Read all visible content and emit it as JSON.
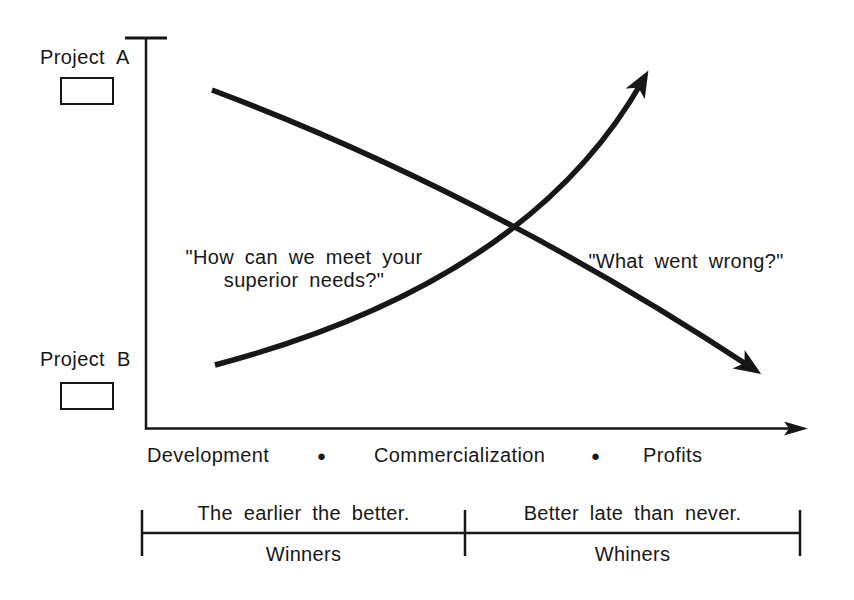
{
  "figure": {
    "projects": [
      {
        "label": "Project A"
      },
      {
        "label": "Project B"
      }
    ],
    "annotations": {
      "early_quote_line1": "\"How can we meet your",
      "early_quote_line2": "superior needs?\"",
      "late_quote": "\"What went wrong?\""
    },
    "x_axis": {
      "stages": [
        "Development",
        "Commercialization",
        "Profits"
      ],
      "separator_glyph": "●"
    },
    "segments": [
      {
        "caption": "The earlier the better.",
        "group": "Winners"
      },
      {
        "caption": "Better late than never.",
        "group": "Whiners"
      }
    ],
    "curves": [
      {
        "project": "Project A",
        "direction": "descending"
      },
      {
        "project": "Project B",
        "direction": "ascending"
      }
    ],
    "colors": {
      "ink": "#171717",
      "background": "#ffffff"
    }
  }
}
